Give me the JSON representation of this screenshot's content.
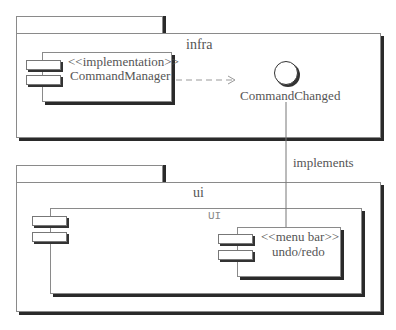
{
  "packages": [
    {
      "name": "infra"
    },
    {
      "name": "ui"
    }
  ],
  "components": [
    {
      "stereotype": "<<implementation>>",
      "name": "CommandManager"
    },
    {
      "stereotype": "<<menu bar>>",
      "name": "undo/redo"
    }
  ],
  "subsystem": {
    "name": "UI"
  },
  "interface": {
    "name": "CommandChanged"
  },
  "relations": {
    "dependency": "dashed arrow CommandManager -> CommandChanged",
    "implements_label": "implements"
  }
}
